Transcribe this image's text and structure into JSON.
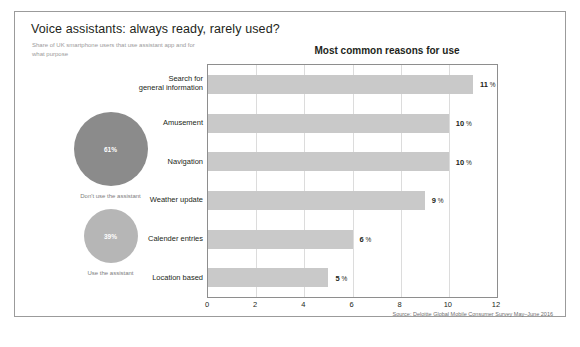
{
  "card": {
    "title": "Voice assistants: always ready, rarely used?",
    "subtitle": "Share of UK smartphone users that use assistant app and for what purpose",
    "source": "Source: Deloitte Global Mobile Consumer Survey May–June 2016"
  },
  "usage": {
    "items": [
      {
        "value": "61%",
        "caption": "Don't use the assistant",
        "color": "#8b8b8b"
      },
      {
        "value": "39%",
        "caption": "Use the assistant",
        "color": "#b6b6b6"
      }
    ]
  },
  "chart_data": {
    "type": "bar",
    "orientation": "horizontal",
    "title": "Most common reasons for use",
    "categories": [
      "Search for\ngeneral information",
      "Amusement",
      "Navigation",
      "Weather update",
      "Calender entries",
      "Location based"
    ],
    "values": [
      11,
      10,
      10,
      9,
      6,
      5
    ],
    "data_labels": [
      "11 %",
      "10 %",
      "10 %",
      "9 %",
      "6 %",
      "5 %"
    ],
    "xlabel": "",
    "ylabel": "",
    "xlim": [
      0,
      12
    ],
    "xticks": [
      0,
      2,
      4,
      6,
      8,
      10,
      12
    ],
    "xticklabels": [
      "0",
      "2",
      "4",
      "6",
      "8",
      "10",
      "12"
    ],
    "grid": "vertical",
    "legend": "none",
    "bar_color": "#c9c9c9"
  }
}
